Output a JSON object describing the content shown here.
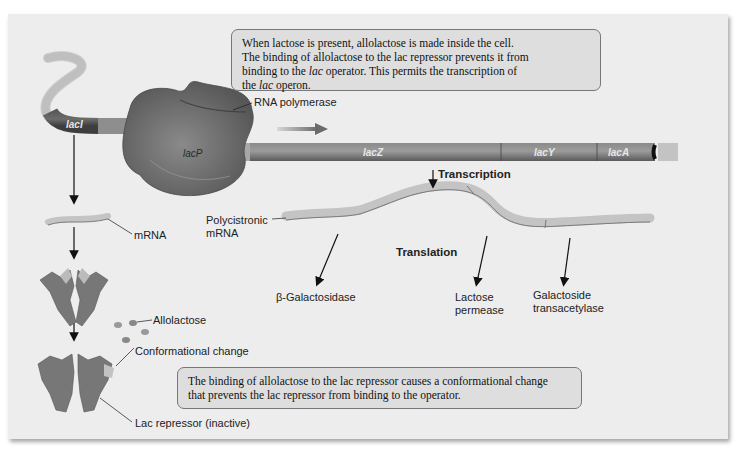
{
  "callouts": {
    "top": {
      "line1": "When lactose is present, allolactose is made inside the cell.",
      "line2": "The binding of allolactose to the lac repressor prevents it from",
      "line3_pre": "binding to the ",
      "line3_it": "lac",
      "line3_post": " operator. This permits the transcription of",
      "line4_pre": "the ",
      "line4_it": "lac",
      "line4_post": " operon."
    },
    "bottom": {
      "line1": "The binding of allolactose to the lac repressor causes a conformational change",
      "line2": "that prevents the lac repressor from binding to the operator."
    }
  },
  "genes": {
    "lacI": "lacI",
    "lacP": "lacP",
    "lacO": "lacO",
    "lacZ": "lacZ",
    "lacY": "lacY",
    "lacA": "lacA"
  },
  "labels": {
    "rna_polymerase": "RNA polymerase",
    "transcription": "Transcription",
    "translation": "Translation",
    "mrna": "mRNA",
    "polycistronic_1": "Polycistronic",
    "polycistronic_2": "mRNA",
    "beta_gal": "β-Galactosidase",
    "permease_1": "Lactose",
    "permease_2": "permease",
    "transacetylase_1": "Galactoside",
    "transacetylase_2": "transacetylase",
    "allolactose": "Allolactose",
    "conformational_change": "Conformational change",
    "lac_repressor": "Lac repressor (inactive)"
  },
  "colors": {
    "panel": "#ededed",
    "dna_dark": "#5a5a5a",
    "dna_light": "#9a9a9a",
    "polymerase": "#6e6e6e",
    "callout_bg": "#dedede"
  }
}
